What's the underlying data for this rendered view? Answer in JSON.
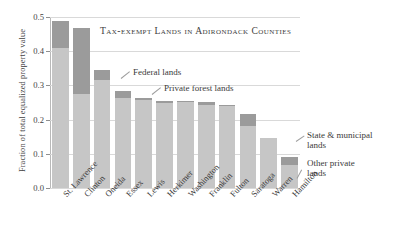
{
  "chart_data": {
    "type": "bar",
    "title": "Tax-exempt Lands in Adirondack Counties",
    "xlabel": "",
    "ylabel": "Fraction of total equalized property value",
    "stacked": true,
    "grid": true,
    "legend_position": "annotations",
    "ylim": [
      0.0,
      0.5
    ],
    "yticks": [
      "0.0",
      "0.1",
      "0.2",
      "0.3",
      "0.4",
      "0.5"
    ],
    "ytick_values": [
      0.0,
      0.1,
      0.2,
      0.3,
      0.4,
      0.5
    ],
    "categories": [
      "St. Lawrence",
      "Clinton",
      "Oneida",
      "Essex",
      "Lewis",
      "Herkimer",
      "Washington",
      "Franklin",
      "Fulton",
      "Saratoga",
      "Warren",
      "Hamilton"
    ],
    "series": [
      {
        "name": "State & municipal lands",
        "color": "#c6c6c6",
        "values": [
          0.41,
          0.275,
          0.315,
          0.262,
          0.258,
          0.249,
          0.253,
          0.243,
          0.241,
          0.18,
          0.146,
          0.068
        ]
      },
      {
        "name": "Federal lands",
        "color": "#9b9b9b",
        "values": [
          0.077,
          0.193,
          0.03,
          0.022,
          0.005,
          0.006,
          0.002,
          0.008,
          0.002,
          0.037,
          0.0,
          0.022
        ]
      }
    ],
    "totals": [
      0.487,
      0.468,
      0.345,
      0.284,
      0.263,
      0.255,
      0.255,
      0.251,
      0.243,
      0.217,
      0.146,
      0.09
    ],
    "annotations": [
      {
        "id": "federal-lands",
        "text": "Federal lands"
      },
      {
        "id": "private-forest-lands",
        "text": "Private forest lands"
      },
      {
        "id": "state-municipal-lands",
        "text": "State & municipal\nlands"
      },
      {
        "id": "other-private-lands",
        "text": "Other private\nlands"
      }
    ],
    "colors": {
      "dark_gray": "#9b9b9b",
      "light_gray": "#c6c6c6",
      "grid": "#d9d9d9",
      "axis": "#b9b9b9",
      "text": "#3a3a3a"
    }
  }
}
